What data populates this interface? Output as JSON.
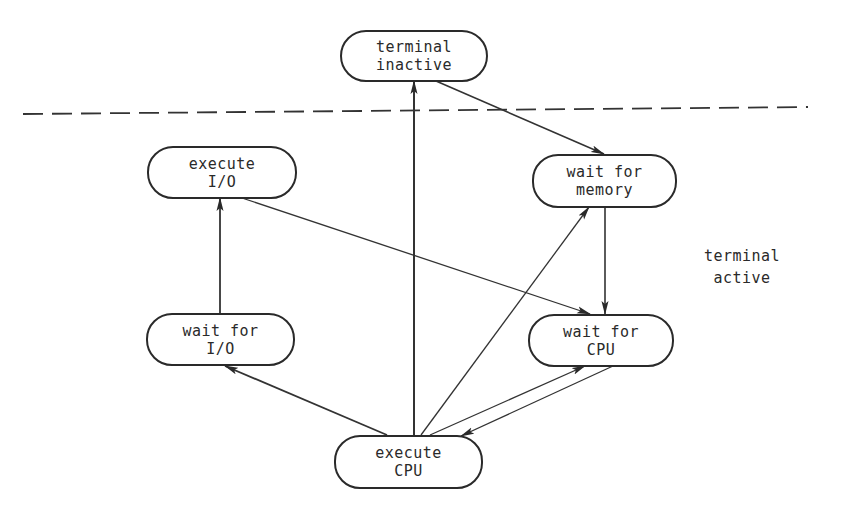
{
  "diagram": {
    "type": "state-transition-diagram",
    "colors": {
      "stroke": "#2a2a2a",
      "background": "#ffffff"
    },
    "boundary": {
      "style": "dashed",
      "regions": {
        "above": "",
        "below": {
          "line1": "terminal",
          "line2": "active"
        }
      }
    },
    "nodes": {
      "terminal_inactive": {
        "line1": "terminal",
        "line2": "inactive"
      },
      "execute_io": {
        "line1": "execute",
        "line2": "I/O"
      },
      "wait_memory": {
        "line1": "wait for",
        "line2": "memory"
      },
      "wait_io": {
        "line1": "wait for",
        "line2": "I/O"
      },
      "wait_cpu": {
        "line1": "wait for",
        "line2": "CPU"
      },
      "execute_cpu": {
        "line1": "execute",
        "line2": "CPU"
      }
    },
    "edges": [
      {
        "from": "terminal inactive",
        "to": "wait for memory"
      },
      {
        "from": "wait for memory",
        "to": "wait for CPU"
      },
      {
        "from": "wait for CPU",
        "to": "execute CPU"
      },
      {
        "from": "execute CPU",
        "to": "wait for CPU"
      },
      {
        "from": "execute CPU",
        "to": "wait for memory"
      },
      {
        "from": "execute CPU",
        "to": "terminal inactive"
      },
      {
        "from": "execute CPU",
        "to": "wait for I/O"
      },
      {
        "from": "wait for I/O",
        "to": "execute I/O"
      },
      {
        "from": "execute I/O",
        "to": "wait for CPU"
      }
    ]
  }
}
